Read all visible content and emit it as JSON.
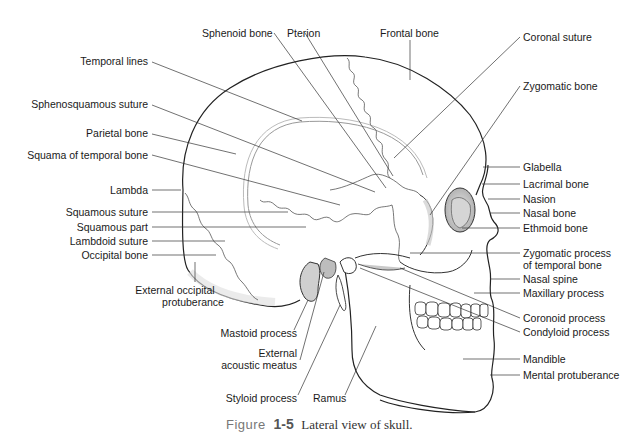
{
  "figure": {
    "title": "Lateral view of skull",
    "caption": {
      "prefix": "Figure",
      "number": "1-5",
      "text": "Lateral view of skull."
    },
    "labels": {
      "sphenoid_bone": "Sphenoid bone",
      "pterion": "Pterion",
      "frontal_bone": "Frontal bone",
      "coronal_suture": "Coronal suture",
      "temporal_lines": "Temporal lines",
      "zygomatic_bone": "Zygomatic bone",
      "sphenosquamous_suture": "Sphenosquamous suture",
      "parietal_bone": "Parietal bone",
      "squama_of_temporal_bone": "Squama of temporal bone",
      "glabella": "Glabella",
      "lacrimal_bone": "Lacrimal bone",
      "lambda": "Lambda",
      "nasion": "Nasion",
      "squamous_suture": "Squamous suture",
      "nasal_bone": "Nasal bone",
      "squamous_part": "Squamous part",
      "ethmoid_bone": "Ethmoid bone",
      "lambdoid_suture": "Lambdoid suture",
      "occipital_bone": "Occipital bone",
      "zygomatic_process_line1": "Zygomatic process",
      "zygomatic_process_line2": "of temporal bone",
      "external_occipital_line1": "External occipital",
      "external_occipital_line2": "protuberance",
      "nasal_spine": "Nasal spine",
      "maxillary_process": "Maxillary process",
      "coronoid_process": "Coronoid process",
      "condyloid_process": "Condyloid process",
      "mastoid_process": "Mastoid process",
      "external_acoustic_line1": "External",
      "external_acoustic_line2": "acoustic meatus",
      "mandible": "Mandible",
      "mental_protuberance": "Mental protuberance",
      "styloid_process": "Styloid process",
      "ramus": "Ramus"
    }
  }
}
